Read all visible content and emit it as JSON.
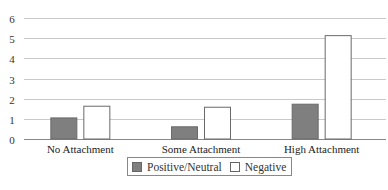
{
  "chart_data": {
    "type": "bar",
    "title": "",
    "xlabel": "",
    "ylabel": "",
    "categories": [
      "No Attachment",
      "Some Attachment",
      "High Attachment"
    ],
    "series": [
      {
        "name": "Positive/Neutral",
        "values": [
          1.07,
          0.63,
          1.75
        ],
        "color": "#7f7f7f"
      },
      {
        "name": "Negative",
        "values": [
          1.65,
          1.6,
          5.15
        ],
        "color": "#ffffff"
      }
    ],
    "ylim": [
      0,
      6
    ],
    "yticks": [
      0,
      1,
      2,
      3,
      4,
      5,
      6
    ],
    "grid": true,
    "legend_position": "bottom"
  },
  "legend": {
    "items": [
      {
        "label": "Positive/Neutral",
        "color": "#7f7f7f"
      },
      {
        "label": "Negative",
        "color": "#ffffff"
      }
    ]
  }
}
